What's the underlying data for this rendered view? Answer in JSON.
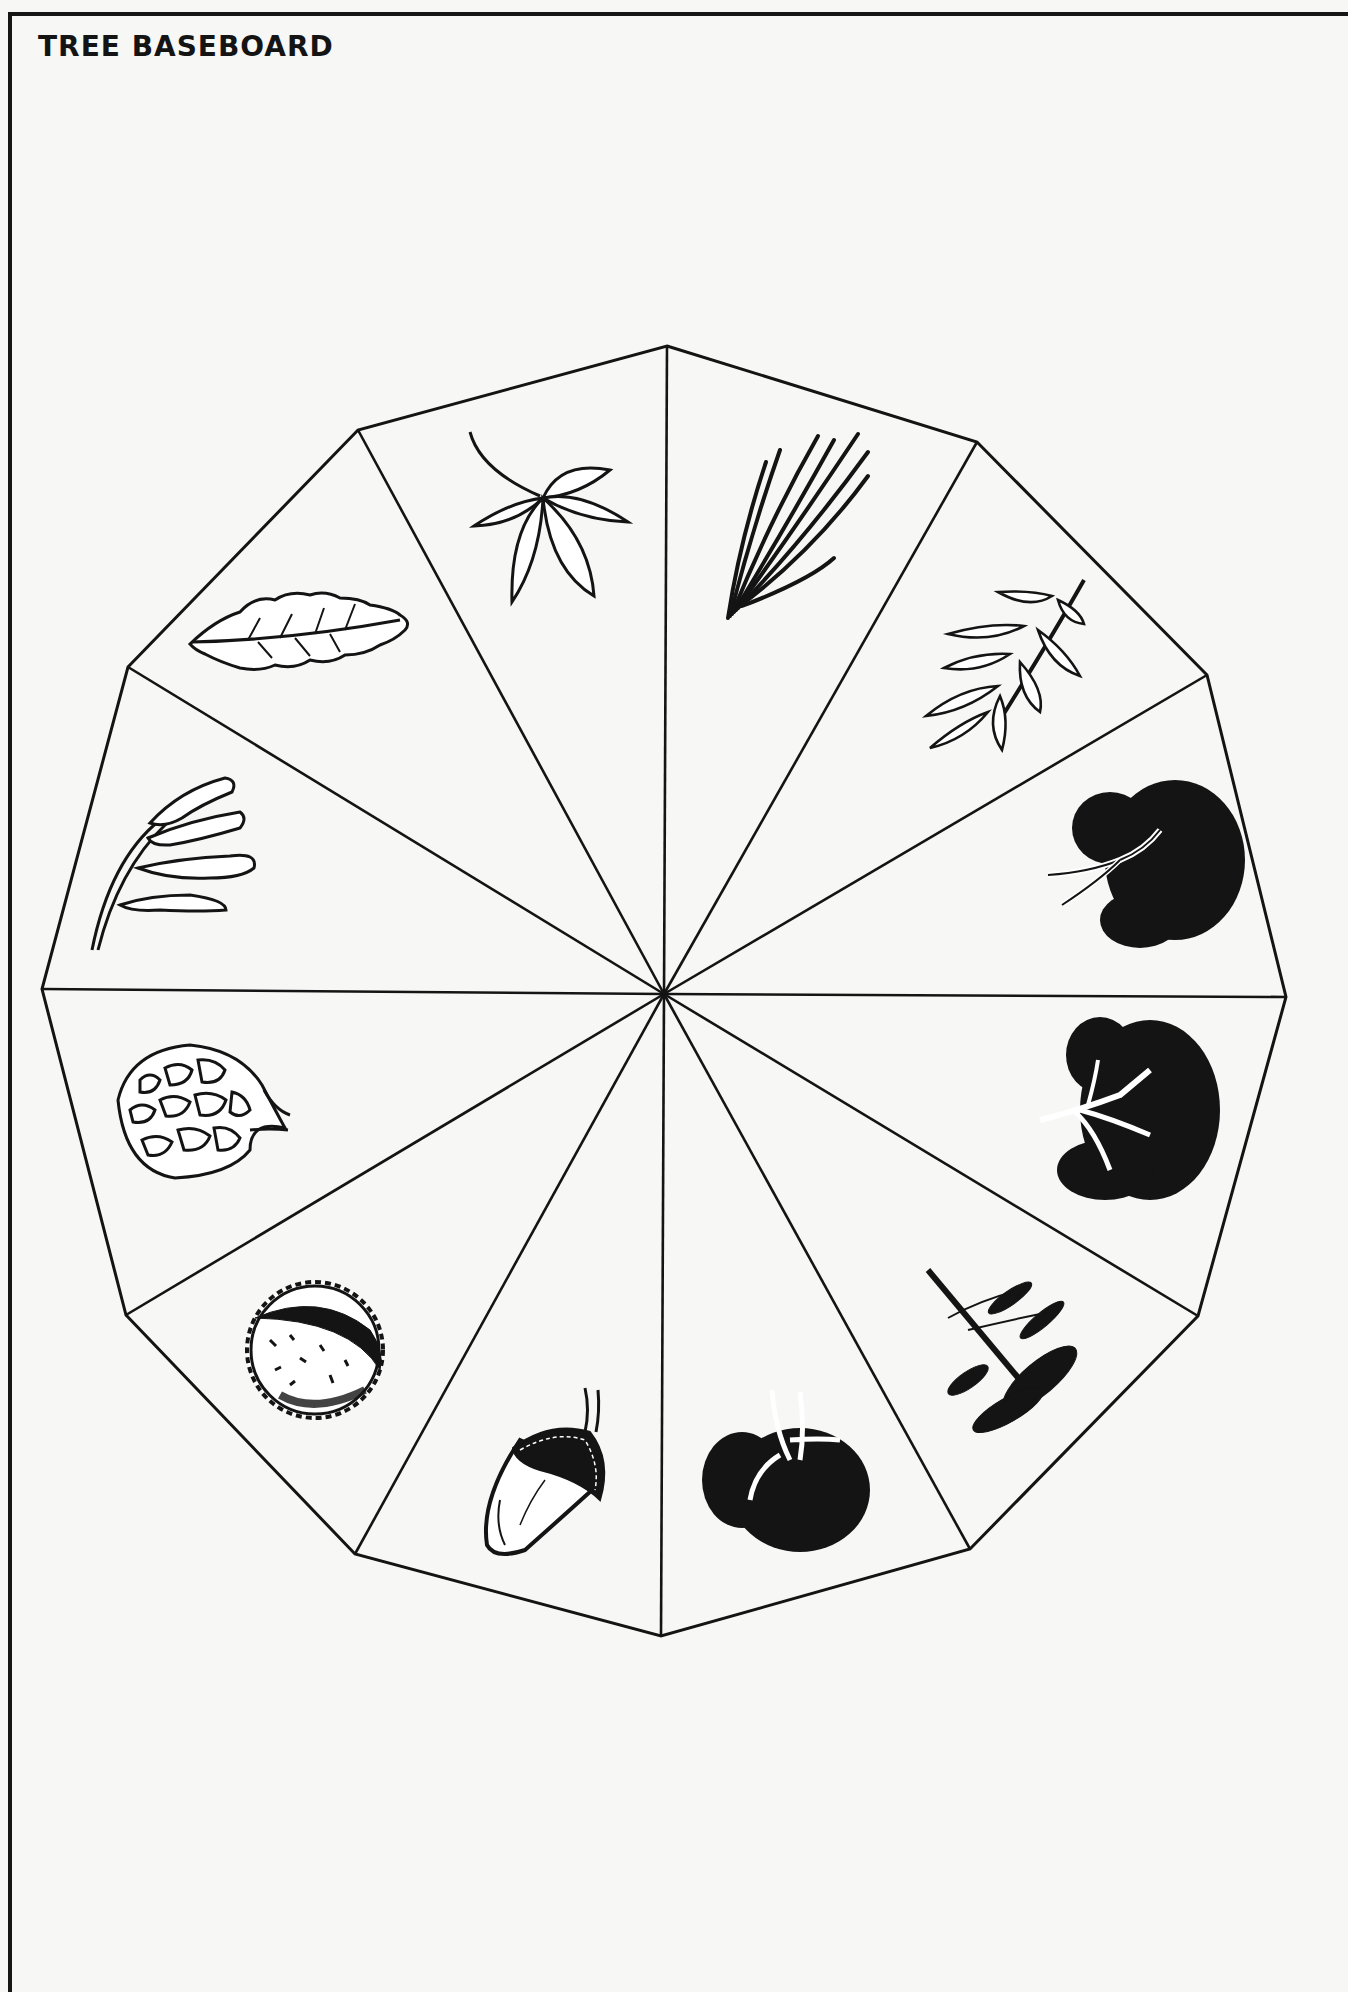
{
  "page": {
    "title": "TREE BASEBOARD",
    "colors": {
      "paper": "#f7f7f6",
      "ink": "#141414"
    }
  },
  "board": {
    "shape": "dodecagon",
    "center": [
      664,
      994
    ],
    "vertices": [
      [
        667,
        346
      ],
      [
        977,
        442
      ],
      [
        1207,
        675
      ],
      [
        1286,
        997
      ],
      [
        1198,
        1316
      ],
      [
        970,
        1549
      ],
      [
        661,
        1636
      ],
      [
        355,
        1554
      ],
      [
        126,
        1315
      ],
      [
        42,
        989
      ],
      [
        128,
        667
      ],
      [
        358,
        430
      ]
    ],
    "segments": [
      {
        "index": 0,
        "illustration": "pine-needles"
      },
      {
        "index": 1,
        "illustration": "ash-leaf"
      },
      {
        "index": 2,
        "illustration": "broadleaf-tree"
      },
      {
        "index": 3,
        "illustration": "spreading-tree"
      },
      {
        "index": 4,
        "illustration": "conifer-tree"
      },
      {
        "index": 5,
        "illustration": "round-tree"
      },
      {
        "index": 6,
        "illustration": "acorn"
      },
      {
        "index": 7,
        "illustration": "conker"
      },
      {
        "index": 8,
        "illustration": "pine-cone"
      },
      {
        "index": 9,
        "illustration": "ash-keys"
      },
      {
        "index": 10,
        "illustration": "oak-leaf"
      },
      {
        "index": 11,
        "illustration": "horse-chestnut-leaf"
      }
    ]
  }
}
